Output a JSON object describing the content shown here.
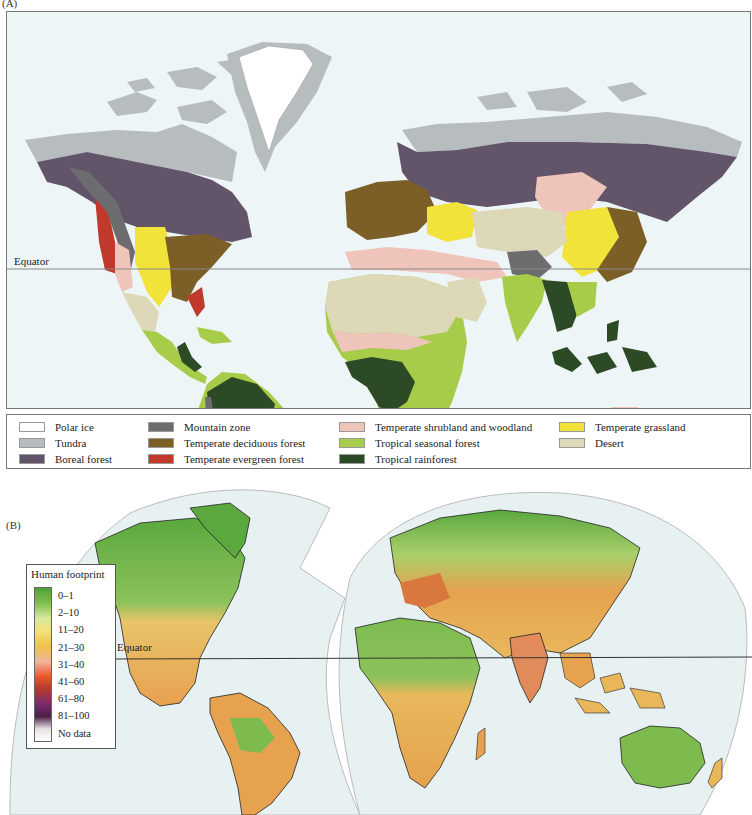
{
  "panel_a": {
    "label": "(A)",
    "equator_label": "Equator",
    "legend": [
      {
        "label": "Polar ice",
        "color": "#ffffff"
      },
      {
        "label": "Tundra",
        "color": "#b7bcbf"
      },
      {
        "label": "Boreal forest",
        "color": "#625569"
      },
      {
        "label": "Mountain zone",
        "color": "#6d6d70"
      },
      {
        "label": "Temperate deciduous forest",
        "color": "#7b5f27"
      },
      {
        "label": "Temperate evergreen forest",
        "color": "#c0392b"
      },
      {
        "label": "Temperate shrubland and woodland",
        "color": "#efc5bb"
      },
      {
        "label": "Tropical seasonal forest",
        "color": "#a6cc4a"
      },
      {
        "label": "Tropical rainforest",
        "color": "#2c4a25"
      },
      {
        "label": "Temperate grassland",
        "color": "#f2e33a"
      },
      {
        "label": "Desert",
        "color": "#dcd8b8"
      }
    ]
  },
  "panel_b": {
    "label": "(B)",
    "equator_label": "Equator",
    "legend": {
      "title": "Human footprint",
      "classes": [
        "0–1",
        "2–10",
        "11–20",
        "21–30",
        "31–40",
        "41–60",
        "61–80",
        "81–100",
        "No data"
      ]
    }
  },
  "colors": {
    "ocean": "#eef5f6",
    "map_b_background": "#e8f1f2"
  }
}
